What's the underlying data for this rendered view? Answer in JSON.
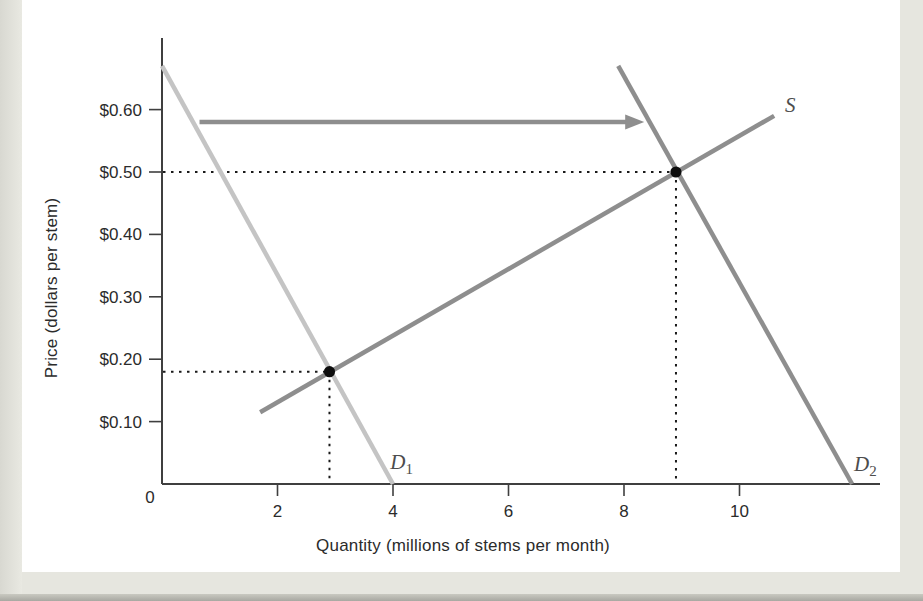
{
  "page": {
    "background": "#e6e6df",
    "panel_background": "#ffffff"
  },
  "chart_data": {
    "type": "line",
    "title": "",
    "xlabel": "Quantity (millions of stems per month)",
    "ylabel": "Price (dollars per stem)",
    "xlim": [
      0,
      12.8
    ],
    "ylim": [
      0,
      0.72
    ],
    "grid": false,
    "origin_label": "0",
    "x_ticks": [
      {
        "value": 2,
        "label": "2"
      },
      {
        "value": 4,
        "label": "4"
      },
      {
        "value": 6,
        "label": "6"
      },
      {
        "value": 8,
        "label": "8"
      },
      {
        "value": 10,
        "label": "10"
      }
    ],
    "y_ticks": [
      {
        "value": 0.6,
        "label": "$0.60"
      },
      {
        "value": 0.5,
        "label": "$0.50"
      },
      {
        "value": 0.4,
        "label": "$0.40"
      },
      {
        "value": 0.3,
        "label": "$0.30"
      },
      {
        "value": 0.2,
        "label": "$0.20"
      },
      {
        "value": 0.1,
        "label": "$0.10"
      }
    ],
    "series": [
      {
        "id": "demand-1",
        "label_main": "D",
        "label_sub": "1",
        "color": "#c4c4c4",
        "points": [
          [
            0,
            0.67
          ],
          [
            4.0,
            0
          ]
        ],
        "label_q": 4.15,
        "label_p": 0.035
      },
      {
        "id": "demand-2",
        "label_main": "D",
        "label_sub": "2",
        "color": "#8e8e8e",
        "points": [
          [
            7.9,
            0.67
          ],
          [
            11.95,
            0
          ]
        ],
        "label_q": 12.18,
        "label_p": 0.032
      },
      {
        "id": "supply",
        "label_main": "S",
        "label_sub": "",
        "color": "#8e8e8e",
        "points": [
          [
            1.7,
            0.115
          ],
          [
            10.6,
            0.59
          ]
        ],
        "label_q": 10.88,
        "label_p": 0.608
      }
    ],
    "equilibria": [
      {
        "id": "initial",
        "quantity": 2.9,
        "price": 0.18
      },
      {
        "id": "new",
        "quantity": 8.9,
        "price": 0.5
      }
    ],
    "shift_arrow": {
      "price": 0.58,
      "from_quantity": 0.65,
      "to_quantity": 8.35,
      "color": "#8e8e8e"
    },
    "styles": {
      "axis_color": "#3f3f3f",
      "tick_text_color": "#2b2b2b",
      "guide_color": "#1a1a1a",
      "dot_color": "#0d0d0d",
      "curve_label_color": "#4d4d4d"
    }
  }
}
